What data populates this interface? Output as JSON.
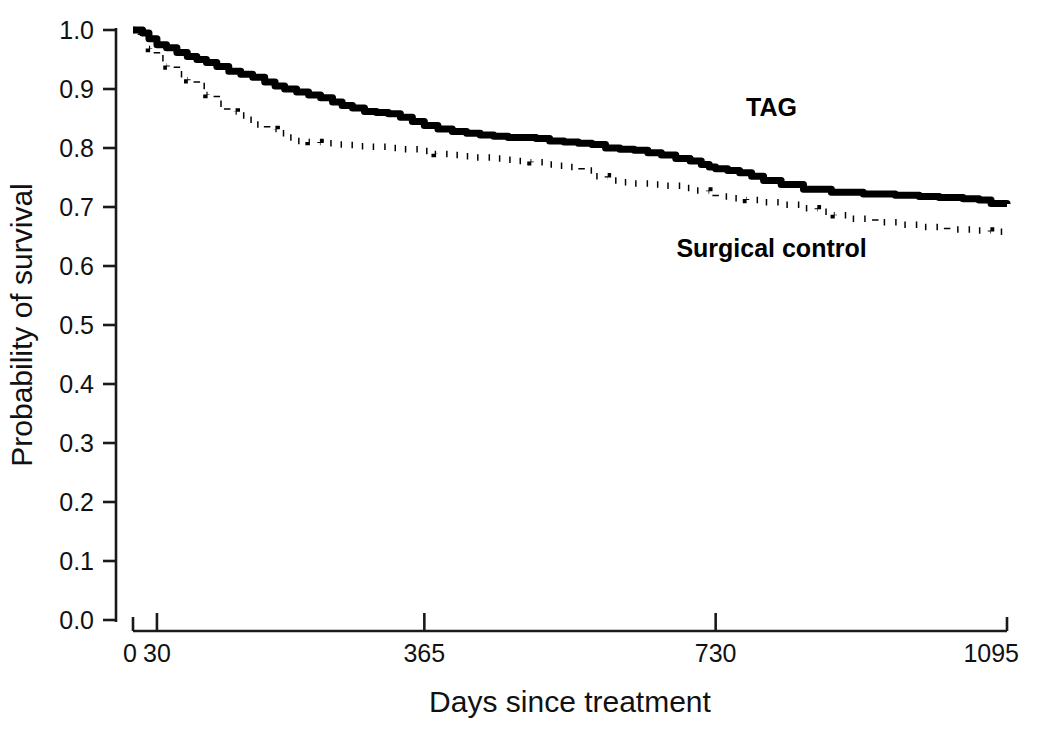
{
  "chart_data": {
    "type": "line",
    "title": "",
    "subtitle": "",
    "xlabel": "Days since treatment",
    "ylabel": "Probability of survival",
    "xlim": [
      0,
      1095
    ],
    "ylim": [
      0.0,
      1.0
    ],
    "grid": false,
    "legend_position": "inline-annotation",
    "x_ticks": [
      0,
      30,
      365,
      730,
      1095
    ],
    "x_tick_labels": [
      "0",
      "30",
      "365",
      "730",
      "1095"
    ],
    "y_ticks": [
      0.0,
      0.1,
      0.2,
      0.3,
      0.4,
      0.5,
      0.6,
      0.7,
      0.8,
      0.9,
      1.0
    ],
    "y_tick_labels": [
      "0.0",
      "0.1",
      "0.2",
      "0.3",
      "0.4",
      "0.5",
      "0.6",
      "0.7",
      "0.8",
      "0.9",
      "1.0"
    ],
    "annotations": [
      {
        "text": "TAG",
        "x": 800,
        "y": 0.855
      },
      {
        "text": "Surgical control",
        "x": 800,
        "y": 0.615
      }
    ],
    "series": [
      {
        "name": "TAG",
        "style": "solid",
        "color": "#000000",
        "step": "post",
        "x": [
          0,
          12,
          20,
          30,
          42,
          55,
          68,
          80,
          92,
          105,
          120,
          135,
          150,
          165,
          178,
          190,
          205,
          220,
          235,
          250,
          262,
          275,
          290,
          305,
          320,
          335,
          350,
          365,
          382,
          400,
          418,
          435,
          452,
          470,
          488,
          505,
          522,
          540,
          558,
          575,
          592,
          610,
          628,
          645,
          662,
          680,
          698,
          712,
          722,
          730,
          745,
          760,
          775,
          790,
          812,
          840,
          875,
          915,
          955,
          985,
          1010,
          1040,
          1060,
          1075,
          1095
        ],
        "y": [
          1.0,
          0.995,
          0.985,
          0.975,
          0.97,
          0.962,
          0.955,
          0.95,
          0.945,
          0.938,
          0.93,
          0.925,
          0.92,
          0.912,
          0.905,
          0.9,
          0.895,
          0.89,
          0.885,
          0.878,
          0.872,
          0.868,
          0.862,
          0.86,
          0.858,
          0.852,
          0.845,
          0.838,
          0.832,
          0.828,
          0.825,
          0.822,
          0.82,
          0.818,
          0.818,
          0.816,
          0.812,
          0.81,
          0.808,
          0.806,
          0.8,
          0.798,
          0.796,
          0.792,
          0.788,
          0.782,
          0.778,
          0.772,
          0.768,
          0.765,
          0.762,
          0.758,
          0.752,
          0.745,
          0.738,
          0.73,
          0.725,
          0.722,
          0.72,
          0.718,
          0.716,
          0.714,
          0.712,
          0.706,
          0.705
        ]
      },
      {
        "name": "Surgical control",
        "style": "dotted",
        "color": "#000000",
        "step": "post",
        "x": [
          0,
          10,
          20,
          30,
          42,
          55,
          68,
          80,
          92,
          105,
          118,
          130,
          142,
          155,
          168,
          180,
          192,
          205,
          220,
          235,
          250,
          268,
          285,
          300,
          320,
          340,
          360,
          378,
          395,
          412,
          430,
          448,
          465,
          480,
          498,
          515,
          532,
          548,
          562,
          578,
          595,
          610,
          628,
          648,
          668,
          688,
          706,
          722,
          730,
          748,
          768,
          790,
          812,
          835,
          858,
          878,
          900,
          930,
          960,
          990,
          1020,
          1050,
          1075,
          1095
        ],
        "y": [
          1.0,
          0.985,
          0.968,
          0.952,
          0.938,
          0.925,
          0.915,
          0.905,
          0.89,
          0.875,
          0.862,
          0.855,
          0.848,
          0.84,
          0.832,
          0.825,
          0.818,
          0.812,
          0.81,
          0.808,
          0.806,
          0.805,
          0.803,
          0.802,
          0.8,
          0.798,
          0.795,
          0.79,
          0.788,
          0.786,
          0.784,
          0.782,
          0.78,
          0.778,
          0.776,
          0.772,
          0.77,
          0.768,
          0.762,
          0.752,
          0.745,
          0.742,
          0.74,
          0.738,
          0.736,
          0.732,
          0.728,
          0.722,
          0.718,
          0.715,
          0.712,
          0.708,
          0.704,
          0.698,
          0.692,
          0.686,
          0.68,
          0.674,
          0.67,
          0.666,
          0.662,
          0.66,
          0.658,
          0.657
        ]
      }
    ]
  },
  "axis": {
    "y_title": "Probability of survival",
    "x_title": "Days since treatment"
  }
}
